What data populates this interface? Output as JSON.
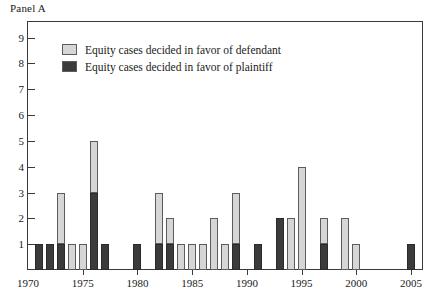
{
  "panel": {
    "title": "Panel A"
  },
  "legend": {
    "position": "inside-top-left",
    "items": [
      {
        "key": "defendant",
        "label": "Equity cases decided in favor of defendant",
        "color": "#d6d6d6"
      },
      {
        "key": "plaintiff",
        "label": "Equity cases decided in favor of plaintiff",
        "color": "#3b3b3b"
      }
    ]
  },
  "axes": {
    "y_tick_labels": [
      "9",
      "8",
      "7",
      "6",
      "5",
      "4",
      "3",
      "2",
      "1"
    ],
    "x_tick_labels": [
      "1970",
      "1975",
      "1980",
      "1985",
      "1990",
      "1995",
      "2000",
      "2005"
    ]
  },
  "chart_data": {
    "type": "bar",
    "stacked": true,
    "title": "Panel A",
    "xlabel": "",
    "ylabel": "",
    "xlim": [
      1970,
      2006
    ],
    "ylim": [
      0,
      9.6
    ],
    "grid": false,
    "legend_position": "inside-top-left",
    "categories": [
      1970,
      1971,
      1972,
      1973,
      1974,
      1975,
      1976,
      1977,
      1978,
      1979,
      1980,
      1981,
      1982,
      1983,
      1984,
      1985,
      1986,
      1987,
      1988,
      1989,
      1990,
      1991,
      1992,
      1993,
      1994,
      1995,
      1996,
      1997,
      1998,
      1999,
      2000,
      2001,
      2002,
      2003,
      2004,
      2005
    ],
    "series": [
      {
        "name": "Equity cases decided in favor of plaintiff",
        "color": "#3b3b3b",
        "values": [
          0,
          1,
          1,
          1,
          0,
          0,
          3,
          1,
          0,
          0,
          1,
          0,
          1,
          1,
          0,
          0,
          0,
          0,
          0,
          1,
          0,
          1,
          0,
          2,
          0,
          0,
          0,
          1,
          0,
          0,
          0,
          0,
          0,
          0,
          0,
          1
        ]
      },
      {
        "name": "Equity cases decided in favor of defendant",
        "color": "#d6d6d6",
        "values": [
          0,
          0,
          0,
          2,
          1,
          1,
          2,
          0,
          0,
          0,
          0,
          0,
          2,
          1,
          1,
          1,
          1,
          2,
          1,
          2,
          0,
          0,
          0,
          0,
          2,
          4,
          0,
          1,
          0,
          2,
          1,
          0,
          0,
          0,
          0,
          0
        ]
      }
    ],
    "totals": [
      0,
      1,
      1,
      3,
      1,
      1,
      5,
      1,
      0,
      0,
      1,
      0,
      3,
      2,
      1,
      1,
      1,
      2,
      1,
      3,
      0,
      1,
      0,
      2,
      2,
      4,
      0,
      2,
      0,
      2,
      1,
      0,
      0,
      0,
      0,
      1
    ]
  }
}
